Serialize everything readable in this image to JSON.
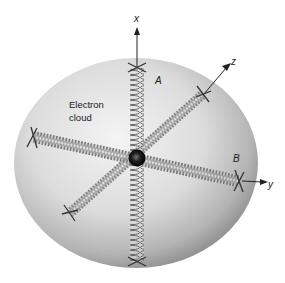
{
  "diagram": {
    "labels": {
      "cloud_line1": "Electron",
      "cloud_line2": "cloud",
      "spring_a": "A",
      "spring_b": "B",
      "axis_x": "x",
      "axis_y": "y",
      "axis_z": "z"
    },
    "colors": {
      "background": "#ffffff",
      "cloud_light": "#f2f2f2",
      "cloud_dark": "#9a9a9a",
      "spring": "#555555",
      "nucleus": "#111111",
      "axis": "#222222"
    }
  }
}
